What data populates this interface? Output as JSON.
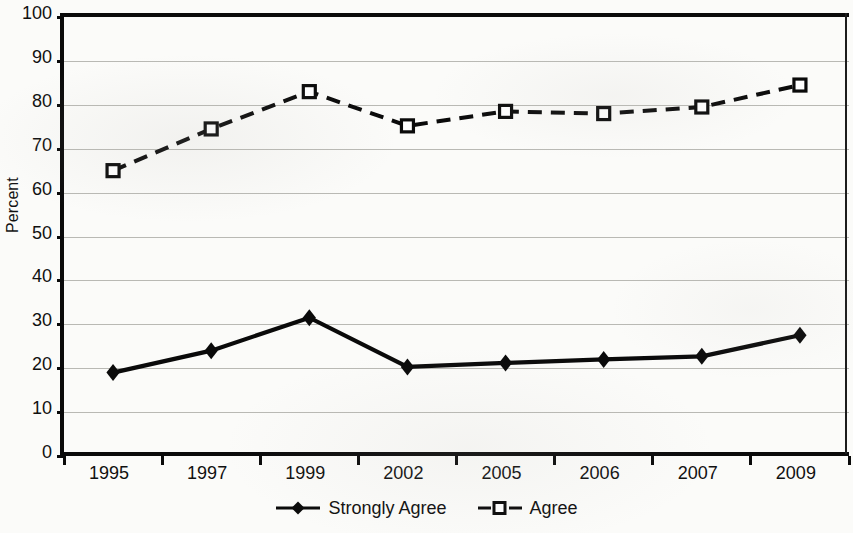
{
  "chart_data": {
    "type": "line",
    "title": "",
    "subtitle": "",
    "xlabel": "",
    "ylabel": "Percent",
    "categories": [
      "1995",
      "1997",
      "1999",
      "2002",
      "2005",
      "2006",
      "2007",
      "2009"
    ],
    "series": [
      {
        "name": "Strongly Agree",
        "values": [
          19,
          24,
          31.5,
          20.3,
          21.2,
          22,
          22.7,
          27.5
        ],
        "line_style": "solid",
        "marker": "filled-diamond",
        "color": "#0a0a0a"
      },
      {
        "name": "Agree",
        "values": [
          65,
          74.5,
          83,
          75.2,
          78.5,
          78,
          79.5,
          84.5
        ],
        "line_style": "dashed",
        "marker": "open-square",
        "color": "#0a0a0a"
      }
    ],
    "ylim": [
      0,
      100
    ],
    "ytick_step": 10,
    "yticks": [
      "0",
      "10",
      "20",
      "30",
      "40",
      "50",
      "60",
      "70",
      "80",
      "90",
      "100"
    ],
    "grid": "horizontal",
    "legend_position": "bottom",
    "gridline_color": "#b9b9b4",
    "axis_color": "#0a0a0a",
    "background_color": "#fbfbf9"
  },
  "axis": {
    "y_title": "Percent"
  },
  "legend": {
    "entries": [
      {
        "label": "Strongly Agree",
        "marker": "filled-diamond-marker",
        "line_style": "solid"
      },
      {
        "label": "Agree",
        "marker": "open-square-marker",
        "line_style": "dashed"
      }
    ]
  }
}
